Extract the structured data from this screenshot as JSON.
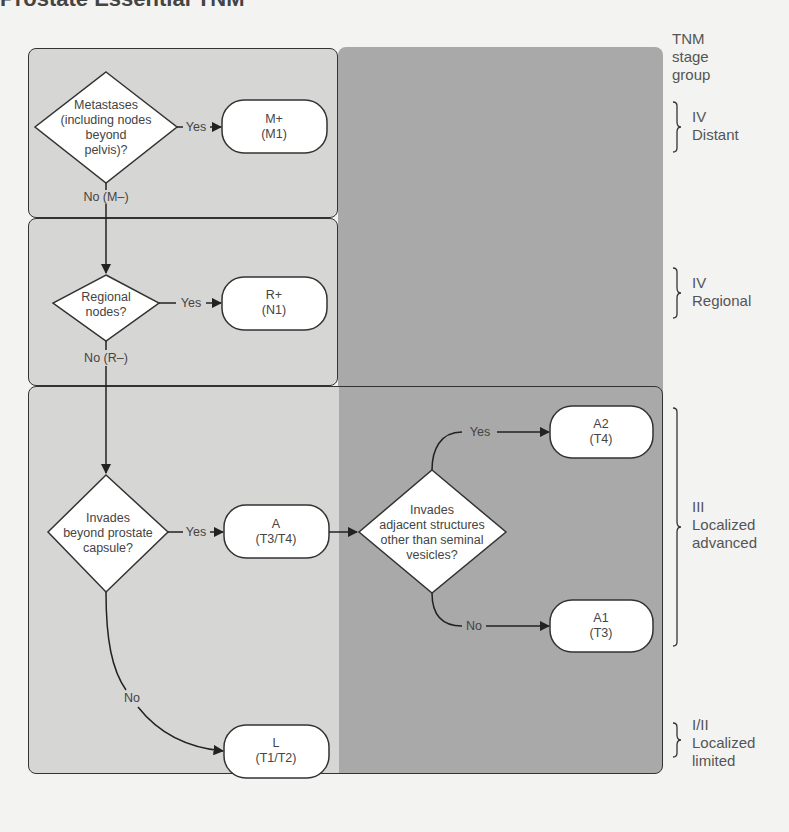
{
  "title": "Prostate Essential TNM",
  "stage_header": {
    "line1": "TNM",
    "line2": "stage",
    "line3": "group"
  },
  "stages": [
    {
      "id": "distant",
      "line1": "IV",
      "line2": "Distant",
      "line3": ""
    },
    {
      "id": "regional",
      "line1": "IV",
      "line2": "Regional",
      "line3": ""
    },
    {
      "id": "localized-advanced",
      "line1": "III",
      "line2": "Localized",
      "line3": "advanced"
    },
    {
      "id": "localized-limited",
      "line1": "I/II",
      "line2": "Localized",
      "line3": "limited"
    }
  ],
  "nodes": {
    "q_metastases": {
      "type": "decision",
      "lines": [
        "Metastases",
        "(including nodes",
        "beyond",
        "pelvis)?"
      ]
    },
    "r_m_plus": {
      "type": "result",
      "lines": [
        "M+",
        "(M1)"
      ]
    },
    "q_regional": {
      "type": "decision",
      "lines": [
        "Regional",
        "nodes?"
      ]
    },
    "r_r_plus": {
      "type": "result",
      "lines": [
        "R+",
        "(N1)"
      ]
    },
    "q_capsule": {
      "type": "decision",
      "lines": [
        "Invades",
        "beyond prostate",
        "capsule?"
      ]
    },
    "r_a": {
      "type": "result",
      "lines": [
        "A",
        "(T3/T4)"
      ]
    },
    "q_adjacent": {
      "type": "decision",
      "lines": [
        "Invades",
        "adjacent structures",
        "other than seminal",
        "vesicles?"
      ]
    },
    "r_a2": {
      "type": "result",
      "lines": [
        "A2",
        "(T4)"
      ]
    },
    "r_a1": {
      "type": "result",
      "lines": [
        "A1",
        "(T3)"
      ]
    },
    "r_l": {
      "type": "result",
      "lines": [
        "L",
        "(T1/T2)"
      ]
    }
  },
  "edges": {
    "metastases_yes": "Yes",
    "metastases_no": "No (M–)",
    "regional_yes": "Yes",
    "regional_no": "No (R–)",
    "capsule_yes": "Yes",
    "capsule_no": "No",
    "adjacent_yes": "Yes",
    "adjacent_no": "No"
  },
  "colors": {
    "background": "#f3f3f2",
    "light_zone": "#d6d6d5",
    "dark_panel": "#a9a9a9",
    "node_fill": "#ffffff",
    "stroke": "#333333"
  }
}
